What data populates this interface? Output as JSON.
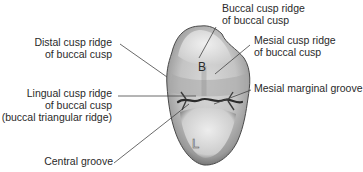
{
  "diagram": {
    "labels": {
      "buccal_cusp_ridge": {
        "line1": "Buccal cusp ridge",
        "line2": "of buccal cusp"
      },
      "distal_cusp_ridge": {
        "line1": "Distal cusp ridge",
        "line2": "of buccal cusp"
      },
      "mesial_cusp_ridge": {
        "line1": "Mesial cusp ridge",
        "line2": "of buccal cusp"
      },
      "mesial_marginal_groove": {
        "line1": "Mesial marginal groove"
      },
      "lingual_cusp_ridge": {
        "line1": "Lingual cusp ridge",
        "line2": "of buccal cusp",
        "line3": "(buccal triangular ridge)"
      },
      "central_groove": {
        "line1": "Central groove"
      }
    },
    "tooth_markers": {
      "buccal": "B",
      "lingual": "L"
    },
    "colors": {
      "text": "#2a2a2a",
      "leader_line": "#444444",
      "tooth_light": "#f2f2f2",
      "tooth_mid": "#bdbdbd",
      "tooth_dark": "#5a5a5a",
      "groove": "#2b2b2b"
    }
  }
}
